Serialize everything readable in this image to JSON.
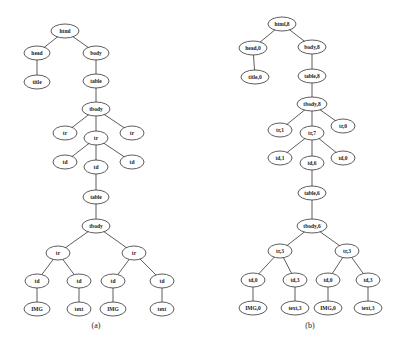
{
  "figure": {
    "trees": [
      {
        "id": "a",
        "caption": "(a)",
        "caption_pos": [
          96,
          328
        ],
        "nodes": [
          {
            "id": "a0",
            "label": "html",
            "x": 65,
            "y": 31,
            "rx": 14
          },
          {
            "id": "a1",
            "label": "head",
            "x": 37,
            "y": 53,
            "rx": 13
          },
          {
            "id": "a2",
            "label": "body",
            "x": 96,
            "y": 53,
            "rx": 13
          },
          {
            "id": "a3",
            "label": "title",
            "x": 37,
            "y": 82,
            "rx": 13
          },
          {
            "id": "a4",
            "label": "table",
            "x": 96,
            "y": 81,
            "rx": 13
          },
          {
            "id": "a5",
            "label": "tbody",
            "x": 96,
            "y": 109,
            "rx": 14
          },
          {
            "id": "a6",
            "label": "tr",
            "x": 65,
            "y": 133,
            "rx": 12
          },
          {
            "id": "a7",
            "label": "tr",
            "x": 96,
            "y": 138,
            "rx": 12
          },
          {
            "id": "a8",
            "label": "tr",
            "x": 132,
            "y": 133,
            "rx": 12
          },
          {
            "id": "a9",
            "label": "td",
            "x": 65,
            "y": 162,
            "rx": 12
          },
          {
            "id": "a10",
            "label": "td",
            "x": 96,
            "y": 167,
            "rx": 12
          },
          {
            "id": "a11",
            "label": "td",
            "x": 132,
            "y": 162,
            "rx": 12
          },
          {
            "id": "a12",
            "label": "table",
            "x": 96,
            "y": 197,
            "rx": 13
          },
          {
            "id": "a13",
            "label": "tbody",
            "x": 96,
            "y": 226,
            "rx": 14
          },
          {
            "id": "a14",
            "label": "tr",
            "x": 58,
            "y": 253,
            "rx": 12
          },
          {
            "id": "a15",
            "label": "tr",
            "x": 134,
            "y": 253,
            "rx": 12
          },
          {
            "id": "a16",
            "label": "td",
            "x": 37,
            "y": 281,
            "rx": 12
          },
          {
            "id": "a17",
            "label": "td",
            "x": 79,
            "y": 281,
            "rx": 12
          },
          {
            "id": "a18",
            "label": "td",
            "x": 113,
            "y": 281,
            "rx": 12
          },
          {
            "id": "a19",
            "label": "td",
            "x": 162,
            "y": 281,
            "rx": 12
          },
          {
            "id": "a20",
            "label": "IMG",
            "x": 37,
            "y": 309,
            "rx": 13
          },
          {
            "id": "a21",
            "label": "text",
            "x": 79,
            "y": 309,
            "rx": 12
          },
          {
            "id": "a22",
            "label": "IMG",
            "x": 113,
            "y": 309,
            "rx": 13
          },
          {
            "id": "a23",
            "label": "text",
            "x": 162,
            "y": 309,
            "rx": 12
          }
        ],
        "edges": [
          [
            "a0",
            "a1"
          ],
          [
            "a0",
            "a2"
          ],
          [
            "a1",
            "a3"
          ],
          [
            "a2",
            "a4"
          ],
          [
            "a4",
            "a5"
          ],
          [
            "a5",
            "a6"
          ],
          [
            "a5",
            "a7"
          ],
          [
            "a5",
            "a8"
          ],
          [
            "a7",
            "a9"
          ],
          [
            "a7",
            "a10"
          ],
          [
            "a7",
            "a11"
          ],
          [
            "a10",
            "a12"
          ],
          [
            "a12",
            "a13"
          ],
          [
            "a13",
            "a14"
          ],
          [
            "a13",
            "a15"
          ],
          [
            "a14",
            "a16"
          ],
          [
            "a14",
            "a17"
          ],
          [
            "a15",
            "a18"
          ],
          [
            "a15",
            "a19"
          ],
          [
            "a16",
            "a20"
          ],
          [
            "a17",
            "a21"
          ],
          [
            "a18",
            "a22"
          ],
          [
            "a19",
            "a23"
          ]
        ]
      },
      {
        "id": "b",
        "caption": "(b)",
        "caption_pos": [
          310,
          328
        ],
        "nodes": [
          {
            "id": "b0",
            "label": "html,8",
            "x": 282,
            "y": 24,
            "rx": 14
          },
          {
            "id": "b1",
            "label": "head,0",
            "x": 253,
            "y": 48,
            "rx": 14
          },
          {
            "id": "b2",
            "label": "body,8",
            "x": 312,
            "y": 47,
            "rx": 14
          },
          {
            "id": "b3",
            "label": "title,0",
            "x": 255,
            "y": 77,
            "rx": 14
          },
          {
            "id": "b4",
            "label": "table,8",
            "x": 312,
            "y": 76,
            "rx": 14
          },
          {
            "id": "b5",
            "label": "tbody,8",
            "x": 312,
            "y": 104,
            "rx": 15
          },
          {
            "id": "b6",
            "label": "tr,1",
            "x": 280,
            "y": 130,
            "rx": 12
          },
          {
            "id": "b7",
            "label": "tr,7",
            "x": 312,
            "y": 133,
            "rx": 12
          },
          {
            "id": "b8",
            "label": "tr,0",
            "x": 343,
            "y": 126,
            "rx": 12
          },
          {
            "id": "b9",
            "label": "td,1",
            "x": 280,
            "y": 158,
            "rx": 12
          },
          {
            "id": "b10",
            "label": "td,6",
            "x": 312,
            "y": 163,
            "rx": 12
          },
          {
            "id": "b11",
            "label": "td,0",
            "x": 343,
            "y": 158,
            "rx": 12
          },
          {
            "id": "b12",
            "label": "table,6",
            "x": 312,
            "y": 193,
            "rx": 14
          },
          {
            "id": "b13",
            "label": "tbody,6",
            "x": 312,
            "y": 226,
            "rx": 15
          },
          {
            "id": "b14",
            "label": "tr,3",
            "x": 280,
            "y": 251,
            "rx": 12
          },
          {
            "id": "b15",
            "label": "tr,3",
            "x": 347,
            "y": 251,
            "rx": 12
          },
          {
            "id": "b16",
            "label": "td,0",
            "x": 253,
            "y": 280,
            "rx": 12
          },
          {
            "id": "b17",
            "label": "td,3",
            "x": 295,
            "y": 280,
            "rx": 12
          },
          {
            "id": "b18",
            "label": "td,0",
            "x": 328,
            "y": 280,
            "rx": 12
          },
          {
            "id": "b19",
            "label": "td,3",
            "x": 368,
            "y": 280,
            "rx": 12
          },
          {
            "id": "b20",
            "label": "IMG,0",
            "x": 253,
            "y": 308,
            "rx": 14
          },
          {
            "id": "b21",
            "label": "text,3",
            "x": 295,
            "y": 308,
            "rx": 14
          },
          {
            "id": "b22",
            "label": "IMG,0",
            "x": 328,
            "y": 308,
            "rx": 14
          },
          {
            "id": "b23",
            "label": "text,3",
            "x": 368,
            "y": 308,
            "rx": 14
          }
        ],
        "edges": [
          [
            "b0",
            "b1"
          ],
          [
            "b0",
            "b2"
          ],
          [
            "b1",
            "b3"
          ],
          [
            "b2",
            "b4"
          ],
          [
            "b4",
            "b5"
          ],
          [
            "b5",
            "b6"
          ],
          [
            "b5",
            "b7"
          ],
          [
            "b5",
            "b8"
          ],
          [
            "b7",
            "b9"
          ],
          [
            "b7",
            "b10"
          ],
          [
            "b7",
            "b11"
          ],
          [
            "b10",
            "b12"
          ],
          [
            "b12",
            "b13"
          ],
          [
            "b13",
            "b14"
          ],
          [
            "b13",
            "b15"
          ],
          [
            "b14",
            "b16"
          ],
          [
            "b14",
            "b17"
          ],
          [
            "b15",
            "b18"
          ],
          [
            "b15",
            "b19"
          ],
          [
            "b16",
            "b20"
          ],
          [
            "b17",
            "b21"
          ],
          [
            "b18",
            "b22"
          ],
          [
            "b19",
            "b23"
          ]
        ]
      }
    ]
  },
  "style": {
    "line_color": "#333333",
    "node_fill": "#ffffff",
    "node_ry": 7,
    "label_size": 5.5,
    "caption_size": 8
  }
}
